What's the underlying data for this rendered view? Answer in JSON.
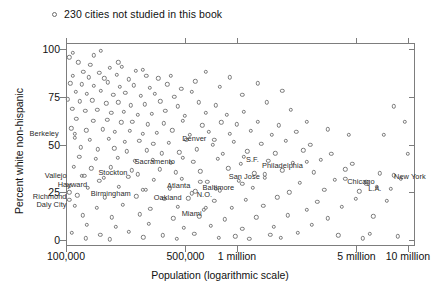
{
  "legend": {
    "marker": "open-circle",
    "text": "230 cities not studied in this book"
  },
  "axis": {
    "x_title": "Population (logarithmic scale)",
    "y_title": "Percent white non-hispanic"
  },
  "chart_data": {
    "type": "scatter",
    "title": "",
    "xlabel": "Population (logarithmic scale)",
    "ylabel": "Percent white non-hispanic",
    "xscale": "log",
    "xlim": [
      100000,
      11000000
    ],
    "ylim": [
      -3,
      103
    ],
    "grid": false,
    "legend_position": "above-plot-left",
    "legend_entries": [
      "230 cities not studied in this book"
    ],
    "yticks": [
      0,
      25,
      50,
      75,
      100
    ],
    "ytick_labels": [
      "0",
      "25",
      "50",
      "75",
      "100"
    ],
    "xticks": [
      100000,
      500000,
      1000000,
      5000000,
      10000000
    ],
    "xtick_labels": [
      "100,000",
      "500,000",
      "1 million",
      "5 million",
      "10 million"
    ],
    "marker_style": "open circle",
    "series": [
      {
        "name": "230 cities not studied in this book",
        "points": [
          [
            0.9,
            95.5
          ],
          [
            3.5,
            93.0
          ],
          [
            7.0,
            91.5
          ],
          [
            12.5,
            90.0
          ],
          [
            5.0,
            88.0
          ],
          [
            9.5,
            87.5
          ],
          [
            16.0,
            90.5
          ],
          [
            20.0,
            88.5
          ],
          [
            2.0,
            86.0
          ],
          [
            6.5,
            85.0
          ],
          [
            11.0,
            84.5
          ],
          [
            14.5,
            86.5
          ],
          [
            18.0,
            84.0
          ],
          [
            23.0,
            86.0
          ],
          [
            26.5,
            84.5
          ],
          [
            1.2,
            82.0
          ],
          [
            4.5,
            81.5
          ],
          [
            8.0,
            80.5
          ],
          [
            12.0,
            82.5
          ],
          [
            15.5,
            80.0
          ],
          [
            19.5,
            81.0
          ],
          [
            24.0,
            79.5
          ],
          [
            29.0,
            81.5
          ],
          [
            33.0,
            79.0
          ],
          [
            2.8,
            77.5
          ],
          [
            6.0,
            76.5
          ],
          [
            10.0,
            78.0
          ],
          [
            13.5,
            76.0
          ],
          [
            17.0,
            77.0
          ],
          [
            21.5,
            75.5
          ],
          [
            25.5,
            76.5
          ],
          [
            31.0,
            75.0
          ],
          [
            36.0,
            77.5
          ],
          [
            0.6,
            73.5
          ],
          [
            4.0,
            72.5
          ],
          [
            7.5,
            73.0
          ],
          [
            11.5,
            71.5
          ],
          [
            15.0,
            72.0
          ],
          [
            18.5,
            70.5
          ],
          [
            22.5,
            71.0
          ],
          [
            27.0,
            72.5
          ],
          [
            32.0,
            70.0
          ],
          [
            38.0,
            72.0
          ],
          [
            43.0,
            70.5
          ],
          [
            1.8,
            68.5
          ],
          [
            5.5,
            67.5
          ],
          [
            9.0,
            68.0
          ],
          [
            13.0,
            66.5
          ],
          [
            16.5,
            67.0
          ],
          [
            20.5,
            65.5
          ],
          [
            24.5,
            66.0
          ],
          [
            28.5,
            67.5
          ],
          [
            34.0,
            65.0
          ],
          [
            40.0,
            66.5
          ],
          [
            46.0,
            65.5
          ],
          [
            51.0,
            67.0
          ],
          [
            3.0,
            63.5
          ],
          [
            7.8,
            62.5
          ],
          [
            11.8,
            63.0
          ],
          [
            15.8,
            61.5
          ],
          [
            19.0,
            62.0
          ],
          [
            23.5,
            60.5
          ],
          [
            28.0,
            61.0
          ],
          [
            33.5,
            62.5
          ],
          [
            39.0,
            60.0
          ],
          [
            44.5,
            61.5
          ],
          [
            49.0,
            60.5
          ],
          [
            55.0,
            62.0
          ],
          [
            61.0,
            60.0
          ],
          [
            1.5,
            58.5
          ],
          [
            5.8,
            57.5
          ],
          [
            10.5,
            58.0
          ],
          [
            14.0,
            56.5
          ],
          [
            18.2,
            57.0
          ],
          [
            22.0,
            55.5
          ],
          [
            26.0,
            56.0
          ],
          [
            30.5,
            57.5
          ],
          [
            35.5,
            55.0
          ],
          [
            41.0,
            56.5
          ],
          [
            47.0,
            55.5
          ],
          [
            53.0,
            57.0
          ],
          [
            59.0,
            55.0
          ],
          [
            66.0,
            56.5
          ],
          [
            2.5,
            53.5
          ],
          [
            6.8,
            52.5
          ],
          [
            12.2,
            53.0
          ],
          [
            16.8,
            51.5
          ],
          [
            21.0,
            52.0
          ],
          [
            25.0,
            50.5
          ],
          [
            29.5,
            51.0
          ],
          [
            34.5,
            52.5
          ],
          [
            42.0,
            50.0
          ],
          [
            48.0,
            51.5
          ],
          [
            56.0,
            50.5
          ],
          [
            63.0,
            52.0
          ],
          [
            70.0,
            50.0
          ],
          [
            4.2,
            48.5
          ],
          [
            9.2,
            47.5
          ],
          [
            13.8,
            48.0
          ],
          [
            17.5,
            46.5
          ],
          [
            23.2,
            47.0
          ],
          [
            27.5,
            45.5
          ],
          [
            32.5,
            46.0
          ],
          [
            37.5,
            47.5
          ],
          [
            45.0,
            45.0
          ],
          [
            52.0,
            46.5
          ],
          [
            60.0,
            45.5
          ],
          [
            68.0,
            47.0
          ],
          [
            76.0,
            45.0
          ],
          [
            3.8,
            43.5
          ],
          [
            8.5,
            42.5
          ],
          [
            14.8,
            43.0
          ],
          [
            19.8,
            41.5
          ],
          [
            24.8,
            42.0
          ],
          [
            30.0,
            40.5
          ],
          [
            36.5,
            41.0
          ],
          [
            43.5,
            42.5
          ],
          [
            50.0,
            40.0
          ],
          [
            58.0,
            41.5
          ],
          [
            65.0,
            40.5
          ],
          [
            73.0,
            42.0
          ],
          [
            82.0,
            40.0
          ],
          [
            2.2,
            38.5
          ],
          [
            7.2,
            37.5
          ],
          [
            12.8,
            38.0
          ],
          [
            18.8,
            36.5
          ],
          [
            26.8,
            37.0
          ],
          [
            31.5,
            35.5
          ],
          [
            38.5,
            36.0
          ],
          [
            46.5,
            37.5
          ],
          [
            54.0,
            35.0
          ],
          [
            62.0,
            36.5
          ],
          [
            71.0,
            35.5
          ],
          [
            80.0,
            37.0
          ],
          [
            90.0,
            35.0
          ],
          [
            5.2,
            33.5
          ],
          [
            10.8,
            32.5
          ],
          [
            17.8,
            33.0
          ],
          [
            25.2,
            31.5
          ],
          [
            33.2,
            32.0
          ],
          [
            40.5,
            30.5
          ],
          [
            49.5,
            31.0
          ],
          [
            57.0,
            32.5
          ],
          [
            67.0,
            30.0
          ],
          [
            77.0,
            31.5
          ],
          [
            86.0,
            30.5
          ],
          [
            96.0,
            32.0
          ],
          [
            1.0,
            28.5
          ],
          [
            6.2,
            27.5
          ],
          [
            15.2,
            28.0
          ],
          [
            22.8,
            26.5
          ],
          [
            29.8,
            27.0
          ],
          [
            37.0,
            25.5
          ],
          [
            44.0,
            26.0
          ],
          [
            53.5,
            27.5
          ],
          [
            64.0,
            25.0
          ],
          [
            74.0,
            26.5
          ],
          [
            84.0,
            25.5
          ],
          [
            93.0,
            27.0
          ],
          [
            3.2,
            23.5
          ],
          [
            11.2,
            22.5
          ],
          [
            20.2,
            23.0
          ],
          [
            28.2,
            21.5
          ],
          [
            35.0,
            22.0
          ],
          [
            42.5,
            20.5
          ],
          [
            51.5,
            21.0
          ],
          [
            60.5,
            22.5
          ],
          [
            72.0,
            20.0
          ],
          [
            83.0,
            21.5
          ],
          [
            92.0,
            20.5
          ],
          [
            2.6,
            18.0
          ],
          [
            8.8,
            17.0
          ],
          [
            16.2,
            18.5
          ],
          [
            24.2,
            16.5
          ],
          [
            32.0,
            17.5
          ],
          [
            39.5,
            16.0
          ],
          [
            47.5,
            17.0
          ],
          [
            56.5,
            18.0
          ],
          [
            69.0,
            16.0
          ],
          [
            79.0,
            17.5
          ],
          [
            4.8,
            13.0
          ],
          [
            13.2,
            12.0
          ],
          [
            21.2,
            13.5
          ],
          [
            30.8,
            11.5
          ],
          [
            38.2,
            12.5
          ],
          [
            45.5,
            11.0
          ],
          [
            54.5,
            12.0
          ],
          [
            63.5,
            13.0
          ],
          [
            75.0,
            11.5
          ],
          [
            88.0,
            12.5
          ],
          [
            6.0,
            8.0
          ],
          [
            14.2,
            7.0
          ],
          [
            23.8,
            8.5
          ],
          [
            33.8,
            6.5
          ],
          [
            41.5,
            7.5
          ],
          [
            50.5,
            6.0
          ],
          [
            59.5,
            7.0
          ],
          [
            70.5,
            8.0
          ],
          [
            1.6,
            4.0
          ],
          [
            9.8,
            3.0
          ],
          [
            18.0,
            4.5
          ],
          [
            27.8,
            2.5
          ],
          [
            36.8,
            3.5
          ],
          [
            48.5,
            2.0
          ],
          [
            58.5,
            3.0
          ],
          [
            66.5,
            4.0
          ],
          [
            78.0,
            2.5
          ],
          [
            87.0,
            3.5
          ],
          [
            5.6,
            1.0
          ],
          [
            12.6,
            0.5
          ],
          [
            22.2,
            1.5
          ],
          [
            31.8,
            0.8
          ],
          [
            43.8,
            1.2
          ],
          [
            52.5,
            0.6
          ],
          [
            61.5,
            1.4
          ],
          [
            85.0,
            1.0
          ],
          [
            95.0,
            2.0
          ],
          [
            98.0,
            45.0
          ],
          [
            97.0,
            62.0
          ],
          [
            94.0,
            70.0
          ],
          [
            91.0,
            55.0
          ],
          [
            89.0,
            28.0
          ],
          [
            81.0,
            55.0
          ],
          [
            75.0,
            58.0
          ],
          [
            69.0,
            62.0
          ],
          [
            64.5,
            68.0
          ],
          [
            57.5,
            72.0
          ],
          [
            50.5,
            76.0
          ],
          [
            44.0,
            80.0
          ],
          [
            37.0,
            83.0
          ],
          [
            30.0,
            86.0
          ],
          [
            22.0,
            89.0
          ],
          [
            15.0,
            93.0
          ],
          [
            8.0,
            96.5
          ],
          [
            2.0,
            98.0
          ],
          [
            10.0,
            99.0
          ],
          [
            40.0,
            88.0
          ],
          [
            47.0,
            85.0
          ],
          [
            55.0,
            82.0
          ],
          [
            62.0,
            78.0
          ]
        ]
      }
    ],
    "labeled_cities": [
      {
        "name": "Berkeley",
        "x": 2.5,
        "y": 55.5,
        "dx": -16,
        "dy": -1
      },
      {
        "name": "Vallejo",
        "x": 4.5,
        "y": 33.5,
        "dx": -15,
        "dy": -1
      },
      {
        "name": "Hayward",
        "x": 9.5,
        "y": 31.0,
        "dx": -12,
        "dy": 3
      },
      {
        "name": "Richmond",
        "x": 1.0,
        "y": 25.0,
        "dx": -3,
        "dy": 4
      },
      {
        "name": "Daly City",
        "x": 1.0,
        "y": 21.0,
        "dx": -3,
        "dy": 4
      },
      {
        "name": "Stockton",
        "x": 20.5,
        "y": 34.5,
        "dx": -10,
        "dy": -2
      },
      {
        "name": "Birmingham",
        "x": 22.0,
        "y": 26.5,
        "dx": -12,
        "dy": 3
      },
      {
        "name": "Sacramento",
        "x": 33.5,
        "y": 43.0,
        "dx": -8,
        "dy": 3
      },
      {
        "name": "Denver",
        "x": 42.5,
        "y": 52.5,
        "dx": -8,
        "dy": -2
      },
      {
        "name": "S.F.",
        "x": 51.0,
        "y": 43.5,
        "dx": 2,
        "dy": 2
      },
      {
        "name": "Atlanta",
        "x": 38.5,
        "y": 30.5,
        "dx": -10,
        "dy": 3
      },
      {
        "name": "N.O.",
        "x": 43.0,
        "y": 27.0,
        "dx": -4,
        "dy": 5
      },
      {
        "name": "Oakland",
        "x": 36.0,
        "y": 24.5,
        "dx": -10,
        "dy": 4
      },
      {
        "name": "Baltimore",
        "x": 50.5,
        "y": 29.5,
        "dx": -8,
        "dy": 3
      },
      {
        "name": "San Jose",
        "x": 57.0,
        "y": 34.5,
        "dx": -5,
        "dy": 2
      },
      {
        "name": "Miami",
        "x": 40.0,
        "y": 17.0,
        "dx": -4,
        "dy": 5
      },
      {
        "name": "Philadelphia",
        "x": 69.0,
        "y": 41.0,
        "dx": -4,
        "dy": 3
      },
      {
        "name": "Chicago",
        "x": 80.0,
        "y": 32.0,
        "dx": 2,
        "dy": 2
      },
      {
        "name": "L.A.",
        "x": 86.0,
        "y": 29.5,
        "dx": 2,
        "dy": 4
      },
      {
        "name": "New York",
        "x": 94.0,
        "y": 34.0,
        "dx": 0,
        "dy": 1
      }
    ]
  }
}
